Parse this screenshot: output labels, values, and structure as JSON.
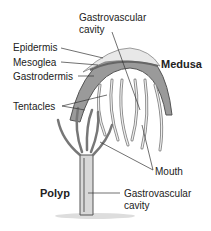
{
  "diagram": {
    "labels": {
      "gastrovascular_top_1": "Gastrovascular",
      "gastrovascular_top_2": "cavity",
      "epidermis": "Epidermis",
      "mesoglea": "Mesoglea",
      "gastrodermis": "Gastrodermis",
      "medusa": "Medusa",
      "tentacles": "Tentacles",
      "mouth": "Mouth",
      "polyp": "Polyp",
      "gastrovascular_bottom_1": "Gastrovascular",
      "gastrovascular_bottom_2": "cavity"
    }
  }
}
